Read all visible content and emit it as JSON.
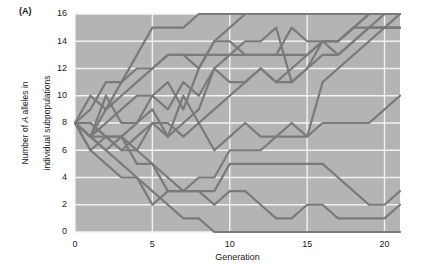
{
  "panel": {
    "label": "(A)"
  },
  "chart_data": {
    "type": "line",
    "title": "",
    "panel_label": "(A)",
    "xlabel": "Generation",
    "ylabel": "Number of A alleles in individual subpopulations",
    "ylabel_line1": "Number of A alleles in",
    "ylabel_line2": "individual subpopulations",
    "xlim": [
      0,
      21
    ],
    "ylim": [
      0,
      16
    ],
    "xticks": [
      0,
      5,
      10,
      15,
      20
    ],
    "yticks": [
      0,
      2,
      4,
      6,
      8,
      10,
      12,
      14,
      16
    ],
    "xtick_labels": [
      "0",
      "5",
      "10",
      "15",
      "20"
    ],
    "ytick_labels": [
      "0",
      "2",
      "4",
      "6",
      "8",
      "10",
      "12",
      "14",
      "16"
    ],
    "grid": true,
    "grid_color": "#f2f2f2",
    "plot_background": "#b4b4b4",
    "line_color": "#7a7a7a",
    "line_width": 2.2,
    "legend": "none",
    "legend_position": "none",
    "annotations": [],
    "x": [
      0,
      1,
      2,
      3,
      4,
      5,
      6,
      7,
      8,
      9,
      10,
      11,
      12,
      13,
      14,
      15,
      16,
      17,
      18,
      19,
      20,
      21
    ],
    "series": [
      {
        "name": "subpopulation-1",
        "values": [
          8,
          10,
          9,
          11,
          13,
          15,
          15,
          15,
          16,
          16,
          16,
          16,
          16,
          16,
          16,
          16,
          16,
          16,
          16,
          16,
          16,
          16
        ]
      },
      {
        "name": "subpopulation-2",
        "values": [
          8,
          9,
          11,
          11,
          12,
          12,
          13,
          13,
          13,
          13,
          13,
          13,
          13,
          13,
          13,
          13,
          14,
          14,
          15,
          15,
          15,
          15
        ]
      },
      {
        "name": "subpopulation-3",
        "values": [
          8,
          7,
          9,
          10,
          11,
          12,
          13,
          13,
          12,
          14,
          14,
          13,
          13,
          13,
          15,
          14,
          14,
          14,
          15,
          16,
          16,
          16
        ]
      },
      {
        "name": "subpopulation-4",
        "values": [
          8,
          7,
          10,
          8,
          8,
          10,
          9,
          11,
          10,
          12,
          13,
          14,
          14,
          15,
          11,
          12,
          14,
          13,
          14,
          15,
          16,
          16
        ]
      },
      {
        "name": "subpopulation-5",
        "values": [
          8,
          7,
          8,
          9,
          10,
          10,
          11,
          9,
          12,
          14,
          15,
          16,
          16,
          16,
          16,
          16,
          16,
          16,
          16,
          16,
          16,
          16
        ]
      },
      {
        "name": "subpopulation-6",
        "values": [
          8,
          6,
          7,
          7,
          8,
          9,
          7,
          10,
          8,
          9,
          10,
          11,
          12,
          11,
          12,
          13,
          14,
          14,
          15,
          16,
          16,
          16
        ]
      },
      {
        "name": "subpopulation-7",
        "values": [
          8,
          8,
          7,
          6,
          7,
          8,
          7,
          8,
          9,
          12,
          11,
          11,
          12,
          11,
          11,
          12,
          13,
          13,
          14,
          15,
          15,
          16
        ]
      },
      {
        "name": "subpopulation-8",
        "values": [
          8,
          7,
          7,
          7,
          6,
          8,
          8,
          7,
          8,
          6,
          7,
          8,
          7,
          7,
          8,
          7,
          11,
          12,
          13,
          14,
          15,
          15
        ]
      },
      {
        "name": "subpopulation-9",
        "values": [
          8,
          8,
          7,
          6,
          6,
          5,
          4,
          3,
          4,
          4,
          6,
          6,
          6,
          7,
          7,
          7,
          8,
          8,
          8,
          8,
          9,
          10
        ]
      },
      {
        "name": "subpopulation-10",
        "values": [
          8,
          7,
          6,
          7,
          5,
          5,
          3,
          3,
          3,
          3,
          5,
          5,
          5,
          5,
          5,
          5,
          5,
          4,
          3,
          2,
          2,
          3
        ]
      },
      {
        "name": "subpopulation-11",
        "values": [
          8,
          6,
          5,
          4,
          4,
          2,
          3,
          3,
          3,
          2,
          3,
          3,
          2,
          1,
          1,
          2,
          2,
          1,
          1,
          1,
          1,
          2
        ]
      },
      {
        "name": "subpopulation-12",
        "values": [
          8,
          7,
          6,
          5,
          4,
          3,
          2,
          1,
          1,
          0,
          0,
          0,
          0,
          0,
          0,
          0,
          0,
          0,
          0,
          0,
          0,
          0
        ]
      }
    ]
  }
}
